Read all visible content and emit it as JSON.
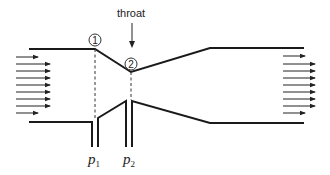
{
  "diagram": {
    "labels": {
      "throat": "throat",
      "section_1": "1",
      "section_2": "2",
      "p1_symbol": "p",
      "p1_sub": "1",
      "p2_symbol": "p",
      "p2_sub": "2"
    },
    "colors": {
      "line": "#1a1a1a",
      "background": "#ffffff"
    },
    "inlet_arrows": 9,
    "outlet_arrows": 9
  }
}
